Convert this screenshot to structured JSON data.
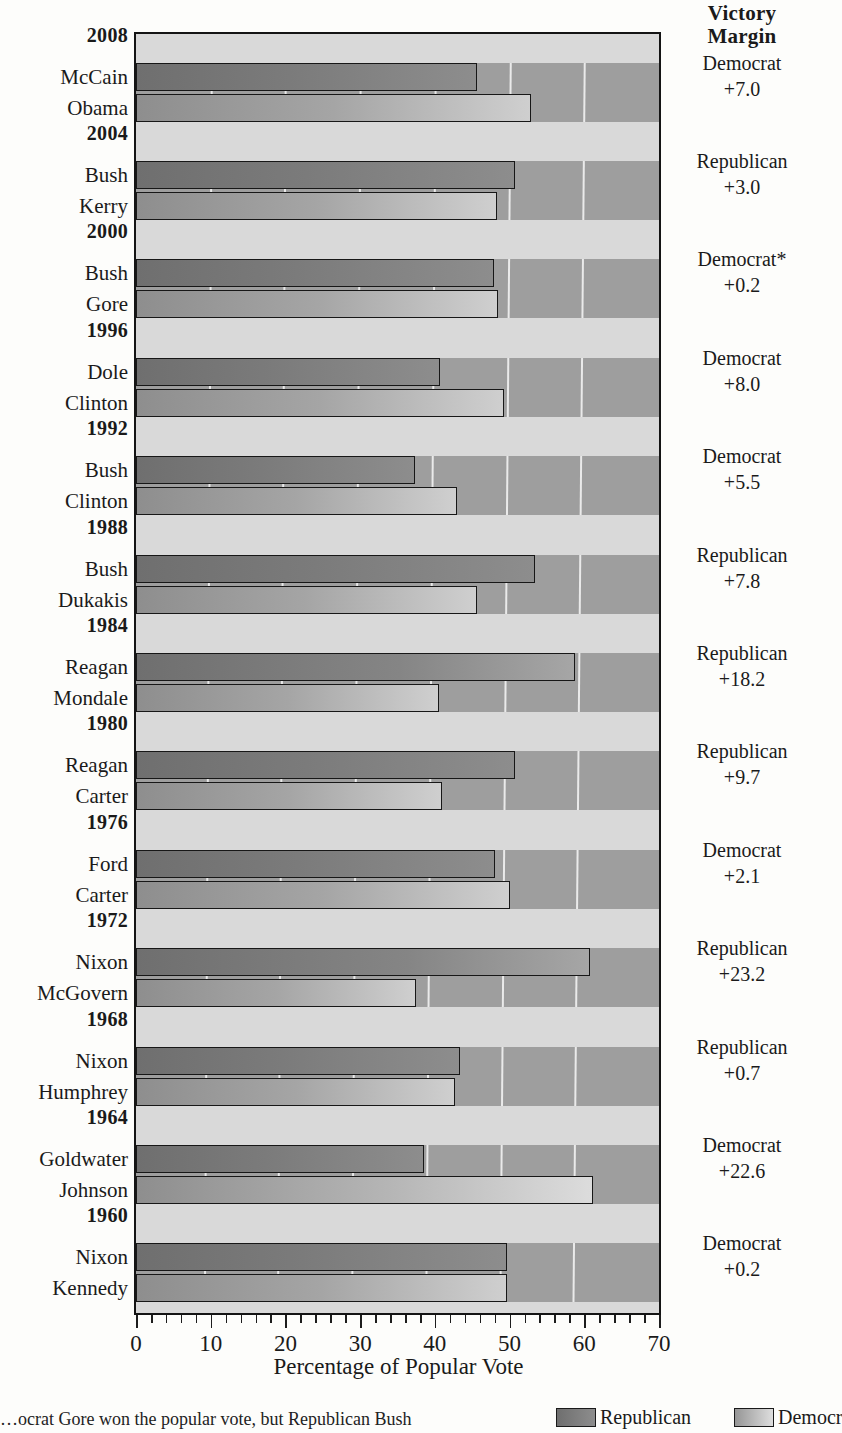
{
  "header": {
    "victory_margin_line1": "Victory",
    "victory_margin_line2": "Margin"
  },
  "axis": {
    "title": "Percentage of Popular Vote",
    "ticks": [
      "0",
      "10",
      "20",
      "30",
      "40",
      "50",
      "60",
      "70"
    ],
    "min": 0,
    "max": 70
  },
  "footnote": {
    "text": "…ocrat Gore won the popular vote, but Republican Bush"
  },
  "legend": {
    "republican": "Republican",
    "democrat": "Democr"
  },
  "colors": {
    "republican_bar": "#7b7b7b",
    "democrat_bar": "#b5b5b5",
    "plot_background": "#9e9e9e",
    "band_background": "#d9d9d9",
    "outline": "#141414"
  },
  "chart_data": {
    "type": "bar",
    "xlabel": "Percentage of Popular Vote",
    "ylabel": "",
    "xlim": [
      0,
      70
    ],
    "grid": true,
    "orientation": "horizontal",
    "legend_position": "bottom-right",
    "series": [
      {
        "name": "Republican",
        "color": "#7b7b7b"
      },
      {
        "name": "Democrat",
        "color": "#b5b5b5"
      }
    ],
    "elections": [
      {
        "year": "2008",
        "republican": {
          "name": "McCain",
          "value": 45.7
        },
        "democrat": {
          "name": "Obama",
          "value": 52.9
        },
        "margin_party": "Democrat",
        "margin_value": "+7.0"
      },
      {
        "year": "2004",
        "republican": {
          "name": "Bush",
          "value": 50.7
        },
        "democrat": {
          "name": "Kerry",
          "value": 48.3
        },
        "margin_party": "Republican",
        "margin_value": "+3.0"
      },
      {
        "year": "2000",
        "republican": {
          "name": "Bush",
          "value": 47.9
        },
        "democrat": {
          "name": "Gore",
          "value": 48.4
        },
        "margin_party": "Democrat*",
        "margin_value": "+0.2"
      },
      {
        "year": "1996",
        "republican": {
          "name": "Dole",
          "value": 40.7
        },
        "democrat": {
          "name": "Clinton",
          "value": 49.2
        },
        "margin_party": "Democrat",
        "margin_value": "+8.0"
      },
      {
        "year": "1992",
        "republican": {
          "name": "Bush",
          "value": 37.4
        },
        "democrat": {
          "name": "Clinton",
          "value": 43.0
        },
        "margin_party": "Democrat",
        "margin_value": "+5.5"
      },
      {
        "year": "1988",
        "republican": {
          "name": "Bush",
          "value": 53.4
        },
        "democrat": {
          "name": "Dukakis",
          "value": 45.6
        },
        "margin_party": "Republican",
        "margin_value": "+7.8"
      },
      {
        "year": "1984",
        "republican": {
          "name": "Reagan",
          "value": 58.8
        },
        "democrat": {
          "name": "Mondale",
          "value": 40.6
        },
        "margin_party": "Republican",
        "margin_value": "+18.2"
      },
      {
        "year": "1980",
        "republican": {
          "name": "Reagan",
          "value": 50.7
        },
        "democrat": {
          "name": "Carter",
          "value": 41.0
        },
        "margin_party": "Republican",
        "margin_value": "+9.7"
      },
      {
        "year": "1976",
        "republican": {
          "name": "Ford",
          "value": 48.0
        },
        "democrat": {
          "name": "Carter",
          "value": 50.1
        },
        "margin_party": "Democrat",
        "margin_value": "+2.1"
      },
      {
        "year": "1972",
        "republican": {
          "name": "Nixon",
          "value": 60.7
        },
        "democrat": {
          "name": "McGovern",
          "value": 37.5
        },
        "margin_party": "Republican",
        "margin_value": "+23.2"
      },
      {
        "year": "1968",
        "republican": {
          "name": "Nixon",
          "value": 43.4
        },
        "democrat": {
          "name": "Humphrey",
          "value": 42.7
        },
        "margin_party": "Republican",
        "margin_value": "+0.7"
      },
      {
        "year": "1964",
        "republican": {
          "name": "Goldwater",
          "value": 38.5
        },
        "democrat": {
          "name": "Johnson",
          "value": 61.1
        },
        "margin_party": "Democrat",
        "margin_value": "+22.6"
      },
      {
        "year": "1960",
        "republican": {
          "name": "Nixon",
          "value": 49.6
        },
        "democrat": {
          "name": "Kennedy",
          "value": 49.7
        },
        "margin_party": "Democrat",
        "margin_value": "+0.2"
      }
    ]
  }
}
